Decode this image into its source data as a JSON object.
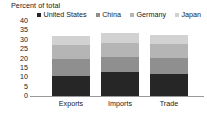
{
  "chart_data": {
    "type": "bar",
    "subtype": "stacked-vertical",
    "title": "Percent of total",
    "xlabel": "",
    "ylabel": "",
    "ylim": [
      0,
      40
    ],
    "yticks": [
      0,
      5,
      10,
      15,
      20,
      25,
      30,
      35,
      40
    ],
    "grid": false,
    "legend_position": "top",
    "categories": [
      "Exports",
      "Imports",
      "Trade"
    ],
    "series": [
      {
        "name": "United States",
        "color": "#262626",
        "values": [
          10.5,
          13.0,
          11.8
        ]
      },
      {
        "name": "China",
        "color": "#8f8f8f",
        "values": [
          9.5,
          8.0,
          8.7
        ]
      },
      {
        "name": "Germany",
        "color": "#b5b5b5",
        "values": [
          7.0,
          7.5,
          7.0
        ]
      },
      {
        "name": "Japan",
        "color": "#d2d2d2",
        "values": [
          5.0,
          5.0,
          5.3
        ]
      }
    ],
    "totals": [
      32.0,
      33.5,
      32.8
    ]
  },
  "axis": {
    "baseline_color": "#9a9a9a"
  }
}
